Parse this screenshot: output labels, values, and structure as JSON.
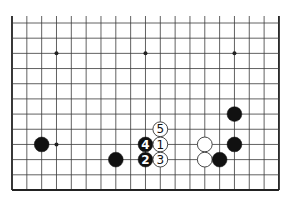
{
  "diagram": {
    "type": "go-board-partial",
    "board_size": 19,
    "visible_rows": [
      8,
      19
    ],
    "visible_cols": [
      1,
      19
    ],
    "open_edge": "top",
    "geometry": {
      "x0": 12,
      "x_step": 14.83,
      "y_top_row": 23,
      "y_step": 15.18,
      "stone_radius": 7.4,
      "open_top_y": 16
    },
    "colors": {
      "line": "#3a3a3a",
      "border": "#222222",
      "black_stone": "#111111",
      "white_stone": "#ffffff",
      "white_stroke": "#333333",
      "black_label": "#ffffff",
      "white_label": "#111111"
    },
    "star_points": [
      {
        "col": 4,
        "row": 10
      },
      {
        "col": 10,
        "row": 10
      },
      {
        "col": 16,
        "row": 10
      },
      {
        "col": 4,
        "row": 16
      },
      {
        "col": 10,
        "row": 16
      },
      {
        "col": 16,
        "row": 16
      }
    ],
    "stones": [
      {
        "color": "black",
        "col": 3,
        "row": 16,
        "label": ""
      },
      {
        "color": "black",
        "col": 8,
        "row": 17,
        "label": ""
      },
      {
        "color": "black",
        "col": 10,
        "row": 16,
        "label": "4"
      },
      {
        "color": "black",
        "col": 10,
        "row": 17,
        "label": "2"
      },
      {
        "color": "white",
        "col": 11,
        "row": 15,
        "label": "5"
      },
      {
        "color": "white",
        "col": 11,
        "row": 16,
        "label": "1"
      },
      {
        "color": "white",
        "col": 11,
        "row": 17,
        "label": "3"
      },
      {
        "color": "white",
        "col": 14,
        "row": 16,
        "label": ""
      },
      {
        "color": "white",
        "col": 14,
        "row": 17,
        "label": ""
      },
      {
        "color": "black",
        "col": 16,
        "row": 14,
        "label": ""
      },
      {
        "color": "black",
        "col": 16,
        "row": 16,
        "label": ""
      },
      {
        "color": "black",
        "col": 15,
        "row": 17,
        "label": ""
      }
    ]
  }
}
